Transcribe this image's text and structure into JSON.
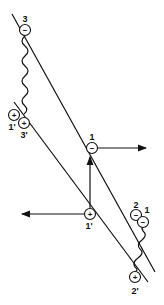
{
  "diagram": {
    "lines": [
      "upper-line",
      "lower-line"
    ],
    "sites": [
      {
        "id": "site-3",
        "label": "3",
        "charge": "−"
      },
      {
        "id": "site-1prime-upper",
        "label": "1'",
        "charge": "+"
      },
      {
        "id": "site-3prime",
        "label": "3'",
        "charge": "+"
      },
      {
        "id": "site-1",
        "label": "1",
        "charge": "−"
      },
      {
        "id": "site-1prime-lower",
        "label": "1'",
        "charge": "+"
      },
      {
        "id": "site-2",
        "label": "2",
        "charge": "−"
      },
      {
        "id": "site-1-right",
        "label": "1",
        "charge": "−"
      },
      {
        "id": "site-2prime",
        "label": "2'",
        "charge": "+"
      }
    ],
    "arrows": [
      {
        "from": "site-1",
        "direction": "right"
      },
      {
        "from": "site-1prime-lower",
        "direction": "left"
      },
      {
        "from": "site-1prime-lower",
        "direction": "up",
        "to": "site-1"
      }
    ],
    "wavy_links": [
      {
        "from": "site-3",
        "to": "site-3prime"
      },
      {
        "from": "site-1-right",
        "to": "site-2prime"
      }
    ]
  }
}
